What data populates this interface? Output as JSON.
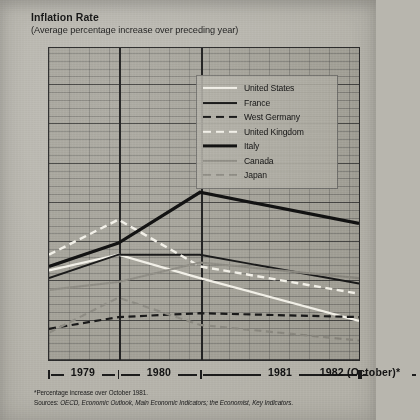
{
  "title": "Inflation Rate",
  "subtitle": "(Average percentage increase over preceding year)",
  "footnotes": {
    "asterisk": "*Percentage increase over October 1981.",
    "sources_prefix": "Sources: ",
    "sources": "OECD, Economic Outlook, Main Economic Indicators; the Economist, Key Indicators."
  },
  "legend": {
    "position": "inside-top-right",
    "entries": [
      {
        "label": "United States",
        "style": "solid",
        "color": "#f2f0e8",
        "width": 2.2,
        "icon": "line-swatch-solid-white"
      },
      {
        "label": "France",
        "style": "solid",
        "color": "#1a1a1a",
        "width": 1.9,
        "icon": "line-swatch-solid-dark"
      },
      {
        "label": "West Germany",
        "style": "dashed",
        "color": "#1a1a1a",
        "width": 2.2,
        "icon": "line-swatch-dashed-dark"
      },
      {
        "label": "United Kingdom",
        "style": "dashed",
        "color": "#f2f0e8",
        "width": 2.4,
        "icon": "line-swatch-dashed-white"
      },
      {
        "label": "Italy",
        "style": "solid",
        "color": "#121212",
        "width": 3.2,
        "icon": "line-swatch-solid-thick-black"
      },
      {
        "label": "Canada",
        "style": "solid",
        "color": "#8e8c84",
        "width": 2.2,
        "icon": "line-swatch-solid-gray"
      },
      {
        "label": "Japan",
        "style": "dashed",
        "color": "#8e8c84",
        "width": 2.2,
        "icon": "line-swatch-dashed-gray"
      }
    ]
  },
  "colors": {
    "background": "#b8b6ae",
    "plot_fill": "#96948b",
    "axis": "#2d2d2d",
    "grid_minor": "#3c3c3c",
    "light_line": "#f2f0e8",
    "dark_line": "#1a1a1a",
    "gray_line": "#8e8c84"
  },
  "chart_data": {
    "type": "line",
    "title": "Inflation Rate",
    "subtitle": "(Average percentage increase over preceding year)",
    "xlabel": "",
    "ylabel": "",
    "ylim": [
      0,
      40
    ],
    "yticks": [
      0,
      5,
      10,
      15,
      20,
      25,
      30,
      35,
      40
    ],
    "ytick_labels": [
      "0",
      "5",
      "10",
      "15",
      "20",
      "25",
      "30",
      "35",
      "40"
    ],
    "grid": true,
    "categories": [
      "1979",
      "1980",
      "1981",
      "1982 (October)*"
    ],
    "x_positions_pct": [
      0,
      22.4,
      48.7,
      74.4
    ],
    "series": [
      {
        "name": "United States",
        "values": [
          11.5,
          13.5,
          10.5,
          5.0
        ],
        "style": "solid",
        "color": "#f2f0e8",
        "width": 2.2
      },
      {
        "name": "France",
        "values": [
          10.5,
          13.5,
          13.5,
          9.8
        ],
        "style": "solid",
        "color": "#1a1a1a",
        "width": 1.9
      },
      {
        "name": "West Germany",
        "values": [
          4.0,
          5.5,
          6.0,
          5.5
        ],
        "style": "dashed",
        "color": "#1a1a1a",
        "width": 2.2
      },
      {
        "name": "United Kingdom",
        "values": [
          13.5,
          18.0,
          12.0,
          8.5
        ],
        "style": "dashed",
        "color": "#f2f0e8",
        "width": 2.4
      },
      {
        "name": "Italy",
        "values": [
          12.0,
          15.0,
          21.5,
          17.5
        ],
        "style": "solid",
        "color": "#121212",
        "width": 3.2
      },
      {
        "name": "Canada",
        "values": [
          9.0,
          10.0,
          12.5,
          10.5
        ],
        "style": "solid",
        "color": "#8e8c84",
        "width": 2.2
      },
      {
        "name": "Japan",
        "values": [
          3.5,
          8.0,
          4.5,
          2.5
        ],
        "style": "dashed",
        "color": "#8e8c84",
        "width": 2.2
      }
    ]
  }
}
